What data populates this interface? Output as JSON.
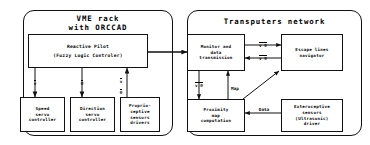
{
  "diagram": {
    "panels": [
      {
        "id": "vme",
        "name": "vme-rack-panel",
        "title": "VME rack\nwith ORCCAD"
      },
      {
        "id": "transputers",
        "name": "transputers-network-panel",
        "title": "Transputers network"
      }
    ],
    "nodes": [
      {
        "id": "reactive_pilot",
        "name": "node-reactive-pilot",
        "line1": "Reactive Pilot",
        "line2": "(Fuzzy Logic Controler)"
      },
      {
        "id": "speed_servo",
        "name": "node-speed-servo-controller",
        "label": "Speed\nservo\ncontroller"
      },
      {
        "id": "direction_servo",
        "name": "node-direction-servo-controller",
        "label": "Direction\nservo\ncontroller"
      },
      {
        "id": "proprioceptive",
        "name": "node-proprioceptive-sensors-drivers",
        "label": "Proprio-\nceptive\nsensors\ndrivers"
      },
      {
        "id": "monitor",
        "name": "node-monitor-and-data-transmission",
        "label": "Monitor and\ndata\ntransmission"
      },
      {
        "id": "escape_lines",
        "name": "node-escape-lines-navigator",
        "label": "Escape lines\nnavigator"
      },
      {
        "id": "proximity_map",
        "name": "node-proximity-map-computation",
        "label": "Proximity\nmap\ncomputation"
      },
      {
        "id": "exteroceptive",
        "name": "node-exteroceptive-sensors-driver",
        "label": "Exteroceptive\nsensors\n(Ultrasonic)\ndriver"
      }
    ],
    "edge_labels": {
      "pilot_to_speed": "v",
      "pilot_to_direction": "θ",
      "proprio_to_pilot_v": "v",
      "proprio_to_pilot_theta": "θ",
      "monitor_to_escape": "v  θ",
      "escape_to_monitor": "v  θ",
      "monitor_to_proximity": "v  θ",
      "proximity_to_monitor": "Map",
      "extero_to_proximity": "Data"
    },
    "colors": {
      "stroke": "#111111",
      "background": "#ffffff",
      "text": "#000000"
    }
  }
}
